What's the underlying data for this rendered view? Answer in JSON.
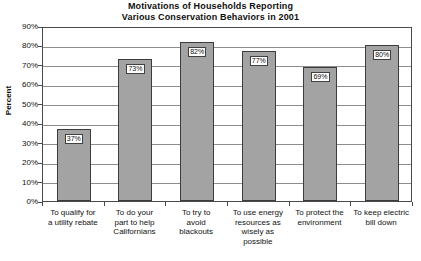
{
  "chart_data": {
    "type": "bar",
    "title": "Motivations of Households Reporting Various Conservation Behaviors in 2001",
    "title_lines": [
      "Motivations of Households Reporting",
      "Various Conservation Behaviors in 2001"
    ],
    "xlabel": "",
    "ylabel": "Percent",
    "ylim": [
      0,
      90
    ],
    "ytick_labels": [
      "90%",
      "80%",
      "70%",
      "60%",
      "50%",
      "40%",
      "30%",
      "20%",
      "10%",
      "0%"
    ],
    "ytick_values": [
      90,
      80,
      70,
      60,
      50,
      40,
      30,
      20,
      10,
      0
    ],
    "grid": true,
    "legend": false,
    "categories": [
      "To qualify for a utility rebate",
      "To do your part to help Californians",
      "To try to avoid blackouts",
      "To use energy resources as wisely as possible",
      "To protect the environment",
      "To keep electric bill down"
    ],
    "category_lines": [
      [
        "To qualify for",
        "a utility rebate"
      ],
      [
        "To do your",
        "part to help",
        "Californians"
      ],
      [
        "To try to",
        "avoid",
        "blackouts"
      ],
      [
        "To use energy",
        "resources as",
        "wisely as",
        "possible"
      ],
      [
        "To protect the",
        "environment"
      ],
      [
        "To keep electric",
        "bill down"
      ]
    ],
    "values": [
      37,
      73,
      82,
      77,
      69,
      80
    ],
    "value_labels": [
      "37%",
      "73%",
      "82%",
      "77%",
      "69%",
      "80%"
    ],
    "colors": {
      "bar_fill": "#a3a3a3",
      "bar_border": "#3c3c3c",
      "gridline": "#8d8d8d",
      "axis": "#4a4a4a",
      "text": "#111111",
      "background": "#ffffff",
      "label_box_fill": "#ffffff"
    }
  }
}
